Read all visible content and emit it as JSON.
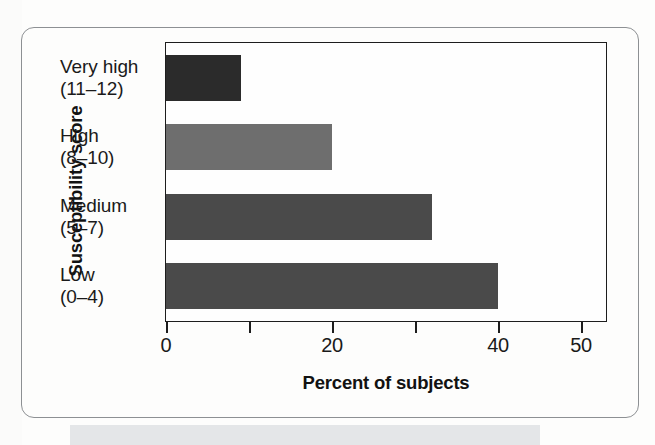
{
  "figure": {
    "frame_color": "#8d9093",
    "background": "#fdfdfc"
  },
  "chart_data": {
    "type": "bar",
    "orientation": "horizontal",
    "title": "",
    "xlabel": "Percent of subjects",
    "ylabel": "Susceptibility score",
    "categories": [
      "Very high\n(11–12)",
      "High\n(8–10)",
      "Medium\n(5–7)",
      "Low\n(0–4)"
    ],
    "category_lines": [
      {
        "name": "Very high",
        "range": "(11–12)"
      },
      {
        "name": "High",
        "range": "(8–10)"
      },
      {
        "name": "Medium",
        "range": "(5–7)"
      },
      {
        "name": "Low",
        "range": "(0–4)"
      }
    ],
    "values": [
      9,
      20,
      32,
      40
    ],
    "bar_colors": [
      "#2b2b2b",
      "#6e6e6e",
      "#4a4a4a",
      "#4a4a4a"
    ],
    "xlim": [
      0,
      53
    ],
    "tick_values": [
      0,
      10,
      20,
      30,
      40,
      50
    ],
    "tick_labels": [
      "0",
      "",
      "20",
      "",
      "40",
      "50"
    ],
    "grid": false,
    "legend": "none",
    "axis_color": "#1d1d1d"
  },
  "axes": {
    "x_title": "Percent of subjects",
    "y_title": "Susceptibility score"
  }
}
